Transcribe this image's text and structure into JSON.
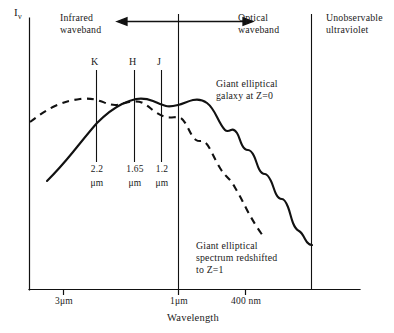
{
  "figure": {
    "y_axis_label": "I",
    "y_axis_label_sub": "ν",
    "x_axis_title": "Wavelength"
  },
  "annotations": {
    "infrared": "Infrared\nwaveband",
    "optical": "Optical\nwaveband",
    "unobservable": "Unobservable\nultraviolet",
    "solid_curve": "Giant elliptical\ngalaxy at Z=0",
    "dashed_curve": "Giant elliptical\nspectrum redshifted\nto Z=1"
  },
  "bands": [
    {
      "letter": "K",
      "value": "2.2",
      "unit": "μm"
    },
    {
      "letter": "H",
      "value": "1.65",
      "unit": "μm"
    },
    {
      "letter": "J",
      "value": "1.2",
      "unit": "μm"
    }
  ],
  "x_ticks": [
    {
      "label": "3μm"
    },
    {
      "label": "1μm"
    },
    {
      "label": "400 nm"
    }
  ],
  "colors": {
    "ink": "#111111",
    "background": "#ffffff"
  },
  "chart_data": {
    "type": "line",
    "title": "",
    "xlabel": "Wavelength",
    "ylabel": "Iν",
    "x_axis_note": "Wavelength decreasing to the right (3μm → 400 nm)",
    "xlim": [
      3.6,
      0.33
    ],
    "ylim": [
      0,
      1
    ],
    "grid": false,
    "legend": "inline annotations",
    "x_tick_labels": [
      "3μm",
      "1μm",
      "400 nm"
    ],
    "x_tick_positions_um": [
      3.0,
      1.0,
      0.4
    ],
    "band_markers": [
      {
        "name": "K",
        "wavelength_um": 2.2
      },
      {
        "name": "H",
        "wavelength_um": 1.65
      },
      {
        "name": "J",
        "wavelength_um": 1.2
      }
    ],
    "vertical_dividers": [
      {
        "name": "infrared-optical-boundary",
        "wavelength_um": 1.0
      },
      {
        "name": "unobservable-ultraviolet-boundary",
        "wavelength_um": 0.32
      }
    ],
    "series": [
      {
        "name": "Giant elliptical galaxy at Z=0",
        "style": "solid",
        "points_um_rel": [
          [
            3.55,
            0.22
          ],
          [
            3.2,
            0.3
          ],
          [
            2.85,
            0.4
          ],
          [
            2.55,
            0.49
          ],
          [
            2.2,
            0.575
          ],
          [
            1.95,
            0.645
          ],
          [
            1.75,
            0.7
          ],
          [
            1.65,
            0.735
          ],
          [
            1.5,
            0.745
          ],
          [
            1.35,
            0.735
          ],
          [
            1.2,
            0.715
          ],
          [
            1.1,
            0.715
          ],
          [
            1.0,
            0.725
          ],
          [
            0.9,
            0.74
          ],
          [
            0.82,
            0.735
          ],
          [
            0.75,
            0.7
          ],
          [
            0.7,
            0.655
          ],
          [
            0.66,
            0.625
          ],
          [
            0.62,
            0.63
          ],
          [
            0.58,
            0.6
          ],
          [
            0.55,
            0.555
          ],
          [
            0.52,
            0.545
          ],
          [
            0.5,
            0.5
          ],
          [
            0.48,
            0.455
          ],
          [
            0.46,
            0.45
          ],
          [
            0.44,
            0.4
          ],
          [
            0.42,
            0.355
          ],
          [
            0.4,
            0.345
          ],
          [
            0.38,
            0.3
          ],
          [
            0.36,
            0.245
          ],
          [
            0.345,
            0.185
          ],
          [
            0.335,
            0.165
          ],
          [
            0.325,
            0.16
          ]
        ]
      },
      {
        "name": "Giant elliptical spectrum redshifted to Z=1",
        "style": "dashed",
        "points_um_rel": [
          [
            3.55,
            0.6
          ],
          [
            3.2,
            0.665
          ],
          [
            2.85,
            0.715
          ],
          [
            2.55,
            0.745
          ],
          [
            2.2,
            0.755
          ],
          [
            1.95,
            0.745
          ],
          [
            1.75,
            0.74
          ],
          [
            1.65,
            0.745
          ],
          [
            1.5,
            0.725
          ],
          [
            1.35,
            0.695
          ],
          [
            1.2,
            0.665
          ],
          [
            1.1,
            0.655
          ],
          [
            1.0,
            0.655
          ],
          [
            0.95,
            0.6
          ],
          [
            0.9,
            0.575
          ],
          [
            0.86,
            0.565
          ],
          [
            0.8,
            0.525
          ],
          [
            0.74,
            0.47
          ],
          [
            0.7,
            0.44
          ],
          [
            0.66,
            0.4
          ],
          [
            0.62,
            0.375
          ],
          [
            0.58,
            0.335
          ],
          [
            0.55,
            0.3
          ],
          [
            0.52,
            0.265
          ],
          [
            0.5,
            0.235
          ],
          [
            0.48,
            0.195
          ],
          [
            0.46,
            0.165
          ],
          [
            0.45,
            0.135
          ]
        ]
      }
    ]
  }
}
